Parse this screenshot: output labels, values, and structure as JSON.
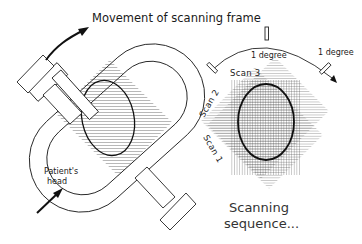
{
  "diagram": {
    "title": "Movement of scanning frame",
    "left_panel": {
      "patient_label_line1": "Patient's",
      "patient_label_line2": "head"
    },
    "right_panel": {
      "rotation_label_1": "1 degree",
      "rotation_label_2": "1 degree",
      "scan_labels": [
        "Scan 3",
        "Scan 2",
        "Scan 1"
      ],
      "caption_line1": "Scanning",
      "caption_line2": "sequence..."
    },
    "colors": {
      "line": "#222222",
      "background": "#ffffff",
      "text": "#1a1a1a"
    }
  }
}
